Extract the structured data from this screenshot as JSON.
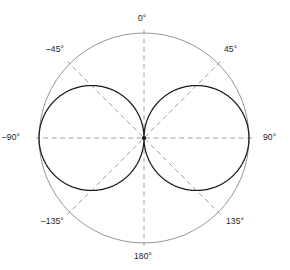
{
  "figure": {
    "kind": "polar-radiation-pattern",
    "colors": {
      "background": "#ffffff",
      "outer_circle": "#8a8a8a",
      "pattern_curve": "#1a1a1a",
      "grid_dashed": "#9a9a9a",
      "label_text": "#1c1c1c"
    },
    "angle_labels": [
      {
        "key": "a0",
        "text": "0°"
      },
      {
        "key": "ap45",
        "text": "45°"
      },
      {
        "key": "an45",
        "text": "–45°"
      },
      {
        "key": "ap90",
        "text": "90°"
      },
      {
        "key": "an90",
        "text": "–90°"
      },
      {
        "key": "ap135",
        "text": "135°"
      },
      {
        "key": "an135",
        "text": "–135°"
      },
      {
        "key": "a180",
        "text": "180°"
      }
    ]
  },
  "chart_data": {
    "type": "line",
    "subtype": "polar",
    "title": "",
    "xlabel": "",
    "ylabel": "",
    "grid": true,
    "legend": null,
    "center_px": {
      "x": 144,
      "y": 138
    },
    "outer_radius_px": 105,
    "radial_axis": {
      "min": 0,
      "max": 1,
      "normalized": true,
      "ticks": []
    },
    "angular_axis": {
      "unit": "degrees",
      "zero_at": "top",
      "direction": "clockwise-positive",
      "tick_labels": [
        "0°",
        "45°",
        "90°",
        "135°",
        "180°",
        "–135°",
        "–90°",
        "–45°"
      ],
      "tick_angles": [
        0,
        45,
        90,
        135,
        180,
        -135,
        -90,
        -45
      ],
      "gridline_style": "dashed"
    },
    "series": [
      {
        "name": "Radiation pattern |sin(θ)|",
        "style": "solid",
        "closed": true,
        "description": "Figure-eight pattern: two tangent circles of radius 0.5 forming lobes at ±90°",
        "theta_deg": [
          0,
          15,
          30,
          45,
          60,
          75,
          90,
          105,
          120,
          135,
          150,
          165,
          180,
          -165,
          -150,
          -135,
          -120,
          -105,
          -90,
          -75,
          -60,
          -45,
          -30,
          -15
        ],
        "r": [
          0.0,
          0.26,
          0.5,
          0.71,
          0.87,
          0.97,
          1.0,
          0.97,
          0.87,
          0.71,
          0.5,
          0.26,
          0.0,
          0.26,
          0.5,
          0.71,
          0.87,
          0.97,
          1.0,
          0.97,
          0.87,
          0.71,
          0.5,
          0.26
        ]
      },
      {
        "name": "Outer reference circle (r = 1)",
        "style": "solid-thin",
        "closed": true,
        "theta_deg": [
          0,
          45,
          90,
          135,
          180,
          -135,
          -90,
          -45
        ],
        "r": [
          1,
          1,
          1,
          1,
          1,
          1,
          1,
          1
        ]
      }
    ],
    "annotations": [
      {
        "at_theta_deg": 90,
        "text": "90°",
        "placement": "outside-right"
      },
      {
        "at_theta_deg": -90,
        "text": "–90°",
        "placement": "outside-left"
      },
      {
        "at_theta_deg": 0,
        "text": "0°",
        "placement": "outside-top"
      },
      {
        "at_theta_deg": 180,
        "text": "180°",
        "placement": "outside-bottom"
      },
      {
        "at_theta_deg": 45,
        "text": "45°",
        "placement": "outside-upper-right"
      },
      {
        "at_theta_deg": -45,
        "text": "–45°",
        "placement": "outside-upper-left"
      },
      {
        "at_theta_deg": 135,
        "text": "135°",
        "placement": "outside-lower-right"
      },
      {
        "at_theta_deg": -135,
        "text": "–135°",
        "placement": "outside-lower-left"
      }
    ]
  }
}
